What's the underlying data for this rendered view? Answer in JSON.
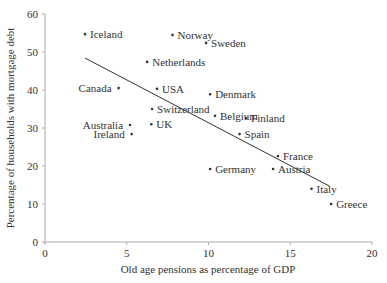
{
  "chart_data": {
    "type": "scatter",
    "title": "",
    "xlabel": "Old age pensions as percentage of GDP",
    "ylabel": "Percentage of households with mortgage debt",
    "xlim": [
      0,
      20
    ],
    "ylim": [
      0,
      60
    ],
    "xticks": [
      0,
      5,
      10,
      15,
      20
    ],
    "yticks": [
      0,
      10,
      20,
      30,
      40,
      50,
      60
    ],
    "grid": false,
    "legend": null,
    "points": [
      {
        "label": "Iceland",
        "x": 2.45,
        "y": 54.7,
        "label_pos": "right"
      },
      {
        "label": "Norway",
        "x": 7.8,
        "y": 54.5,
        "label_pos": "right"
      },
      {
        "label": "Sweden",
        "x": 9.85,
        "y": 52.4,
        "label_pos": "right"
      },
      {
        "label": "Netherlands",
        "x": 6.25,
        "y": 47.4,
        "label_pos": "right"
      },
      {
        "label": "Canada",
        "x": 4.5,
        "y": 40.5,
        "label_pos": "left"
      },
      {
        "label": "USA",
        "x": 6.85,
        "y": 40.3,
        "label_pos": "right"
      },
      {
        "label": "Switzerland",
        "x": 6.55,
        "y": 35.0,
        "label_pos": "right"
      },
      {
        "label": "Denmark",
        "x": 10.1,
        "y": 38.9,
        "label_pos": "right"
      },
      {
        "label": "Belgium",
        "x": 10.4,
        "y": 33.2,
        "label_pos": "right"
      },
      {
        "label": "Finland",
        "x": 12.3,
        "y": 32.6,
        "label_pos": "right"
      },
      {
        "label": "Australia",
        "x": 5.2,
        "y": 30.8,
        "label_pos": "left"
      },
      {
        "label": "UK",
        "x": 6.5,
        "y": 31.0,
        "label_pos": "right"
      },
      {
        "label": "Ireland",
        "x": 5.3,
        "y": 28.4,
        "label_pos": "left"
      },
      {
        "label": "Spain",
        "x": 11.9,
        "y": 28.4,
        "label_pos": "right"
      },
      {
        "label": "France",
        "x": 14.25,
        "y": 22.6,
        "label_pos": "right"
      },
      {
        "label": "Germany",
        "x": 10.1,
        "y": 19.2,
        "label_pos": "right"
      },
      {
        "label": "Austria",
        "x": 13.95,
        "y": 19.2,
        "label_pos": "right"
      },
      {
        "label": "Italy",
        "x": 16.3,
        "y": 14.0,
        "label_pos": "right"
      },
      {
        "label": "Greece",
        "x": 17.5,
        "y": 10.0,
        "label_pos": "right"
      }
    ],
    "trendline": {
      "x1": 2.45,
      "y1": 48.4,
      "x2": 17.4,
      "y2": 14.7
    }
  }
}
